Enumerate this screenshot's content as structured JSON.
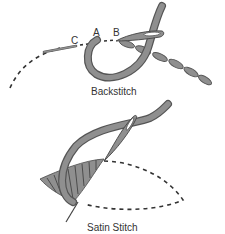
{
  "figure": {
    "colors": {
      "thread_fill": "#8f8f8f",
      "thread_outline": "#555555",
      "stitch_line": "#333333",
      "text": "#333333",
      "background": "#ffffff"
    },
    "backstitch": {
      "caption": "Backstitch",
      "point_labels": {
        "a": "A",
        "b": "B",
        "c": "C"
      }
    },
    "satin_stitch": {
      "caption": "Satin Stitch"
    }
  }
}
